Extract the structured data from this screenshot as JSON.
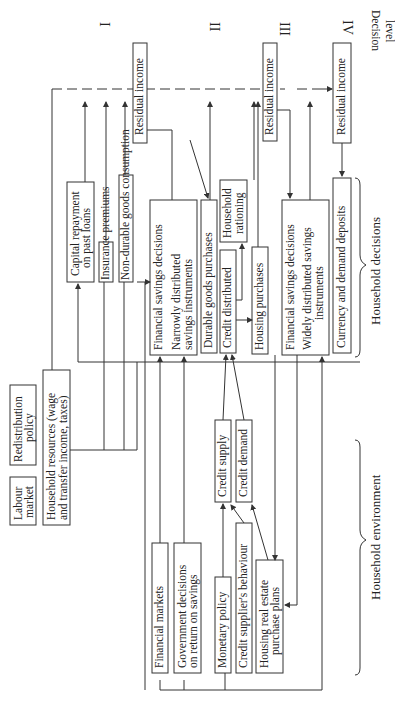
{
  "decision_levels": {
    "title_line1": "Decision",
    "title_line2": "level",
    "levels": [
      "I",
      "II",
      "III",
      "IV"
    ]
  },
  "boxes": {
    "labour_market": [
      "Labour",
      "market"
    ],
    "redistribution_policy": [
      "Redistribution",
      "policy"
    ],
    "household_resources": [
      "Household resources (wage",
      "and transfer income, taxes)"
    ],
    "capital_repayment": [
      "Capital repayment",
      "on past loans"
    ],
    "insurance_premiums": "Insurance premiums",
    "non_durable": "Non-durable goods consumption",
    "residual_income_1": "Residual income",
    "financial_savings_narrow": [
      "Financial savings decisions",
      "Narrowly distributed",
      "savings instruments"
    ],
    "durable_goods": "Durable goods purchases",
    "credit_distributed": "Credit distributed",
    "household_rationing": [
      "Household",
      "rationing"
    ],
    "housing_purchases": "Housing purchases",
    "residual_income_2": "Residual income",
    "financial_savings_wide": [
      "Financial savings decisions",
      "Widely distributed savings",
      "instruments"
    ],
    "currency_deposits": "Currency and demand deposits",
    "residual_income_3": "Residual income",
    "financial_markets": "Financial markets",
    "government_decisions": [
      "Government decisions",
      "on return on savings"
    ],
    "monetary_policy": "Monetary policy",
    "credit_supplier": "Credit supplier's behaviour",
    "housing_real_estate": [
      "Housing real estate",
      "purchase plans"
    ],
    "credit_supply": "Credit supply",
    "credit_demand": "Credit demand"
  },
  "groups": {
    "household_decisions": "Household decisions",
    "household_environment": "Household environment"
  }
}
